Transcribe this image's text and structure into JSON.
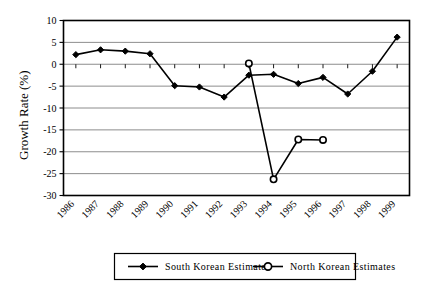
{
  "chart_data": {
    "type": "line",
    "title": "",
    "xlabel": "",
    "ylabel": "Growth Rate (%)",
    "ylim": [
      -30,
      10
    ],
    "ytick_labels": [
      "10",
      "5",
      "0",
      "-5",
      "-10",
      "-15",
      "-20",
      "-25",
      "-30"
    ],
    "yticks": [
      10,
      5,
      0,
      -5,
      -10,
      -15,
      -20,
      -25,
      -30
    ],
    "grid": true,
    "legend_position": "bottom",
    "categories": [
      "1986",
      "1987",
      "1988",
      "1989",
      "1990",
      "1991",
      "1992",
      "1993",
      "1994",
      "1995",
      "1996",
      "1997",
      "1998",
      "1999"
    ],
    "series": [
      {
        "name": "South Korean Estimates",
        "marker": "filled-diamond",
        "color": "#000000",
        "values": [
          2.2,
          3.3,
          3.0,
          2.4,
          -4.9,
          -5.2,
          -7.5,
          -2.5,
          -2.3,
          -4.4,
          -3.0,
          -6.8,
          -1.6,
          6.2
        ]
      },
      {
        "name": "North Korean Estimates",
        "marker": "open-circle",
        "color": "#000000",
        "values": [
          null,
          null,
          null,
          null,
          null,
          null,
          null,
          0.2,
          -26.3,
          -17.2,
          -17.3,
          null,
          null,
          null
        ]
      }
    ]
  },
  "legend": {
    "entries": [
      {
        "label": "South Korean Estimates",
        "marker": "filled-diamond"
      },
      {
        "label": "North Korean Estimates",
        "marker": "open-circle"
      }
    ]
  },
  "colors": {
    "axis": "#000000",
    "grid": "#808080",
    "background": "#ffffff",
    "series_south": "#000000",
    "series_north": "#000000"
  }
}
